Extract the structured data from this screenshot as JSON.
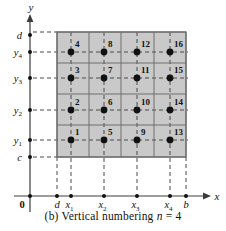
{
  "figure": {
    "caption_prefix": "(b)",
    "caption_main": "Vertical numbering",
    "caption_var": "n",
    "caption_eq": "= 4",
    "caption_full": "(b) Vertical numbering n = 4",
    "colors": {
      "grid_fill": "#c9c9c9",
      "grid_line": "#6e6e6e",
      "axis": "#3c3c3c",
      "dashed": "#4a4a4a",
      "node": "#111111",
      "text": "#111111",
      "background": "#ffffff"
    },
    "axes": {
      "x_axis_label": "x",
      "y_axis_label": "y",
      "origin_label": "0"
    },
    "x_ticks": [
      {
        "label": "d",
        "sub": "",
        "x": 57,
        "italic": true
      },
      {
        "label": "x",
        "sub": "1",
        "x": 71,
        "italic": true
      },
      {
        "label": "x",
        "sub": "2",
        "x": 104,
        "italic": true
      },
      {
        "label": "x",
        "sub": "3",
        "x": 137,
        "italic": true
      },
      {
        "label": "x",
        "sub": "4",
        "x": 170,
        "italic": true
      },
      {
        "label": "b",
        "sub": "",
        "x": 186,
        "italic": true
      }
    ],
    "y_ticks": [
      {
        "label": "d",
        "sub": "",
        "y": 35,
        "italic": true
      },
      {
        "label": "y",
        "sub": "4",
        "y": 52,
        "italic": true
      },
      {
        "label": "y",
        "sub": "3",
        "y": 78,
        "italic": true
      },
      {
        "label": "y",
        "sub": "2",
        "y": 110,
        "italic": true
      },
      {
        "label": "y",
        "sub": "1",
        "y": 140,
        "italic": true
      },
      {
        "label": "c",
        "sub": "",
        "y": 157,
        "italic": true
      }
    ],
    "grid": {
      "left": 57,
      "right": 186,
      "top": 32,
      "bottom": 157,
      "columns": 4,
      "rows": 4,
      "v_lines": [
        57,
        89,
        121,
        154,
        186
      ],
      "h_lines": [
        32,
        63,
        94,
        125,
        157
      ]
    },
    "numbering_scheme": "vertical",
    "n": 4,
    "nodes": [
      {
        "number": "1",
        "x": 71,
        "y": 140,
        "col": 1,
        "row": 1
      },
      {
        "number": "2",
        "x": 71,
        "y": 110,
        "col": 1,
        "row": 2
      },
      {
        "number": "3",
        "x": 71,
        "y": 78,
        "col": 1,
        "row": 3
      },
      {
        "number": "4",
        "x": 71,
        "y": 52,
        "col": 1,
        "row": 4
      },
      {
        "number": "5",
        "x": 104,
        "y": 140,
        "col": 2,
        "row": 1
      },
      {
        "number": "6",
        "x": 104,
        "y": 110,
        "col": 2,
        "row": 2
      },
      {
        "number": "7",
        "x": 104,
        "y": 78,
        "col": 2,
        "row": 3
      },
      {
        "number": "8",
        "x": 104,
        "y": 52,
        "col": 2,
        "row": 4
      },
      {
        "number": "9",
        "x": 137,
        "y": 140,
        "col": 3,
        "row": 1
      },
      {
        "number": "10",
        "x": 137,
        "y": 110,
        "col": 3,
        "row": 2
      },
      {
        "number": "11",
        "x": 137,
        "y": 78,
        "col": 3,
        "row": 3
      },
      {
        "number": "12",
        "x": 137,
        "y": 52,
        "col": 3,
        "row": 4
      },
      {
        "number": "13",
        "x": 170,
        "y": 140,
        "col": 4,
        "row": 1
      },
      {
        "number": "14",
        "x": 170,
        "y": 110,
        "col": 4,
        "row": 2
      },
      {
        "number": "15",
        "x": 170,
        "y": 78,
        "col": 4,
        "row": 3
      },
      {
        "number": "16",
        "x": 170,
        "y": 52,
        "col": 4,
        "row": 4
      }
    ]
  }
}
